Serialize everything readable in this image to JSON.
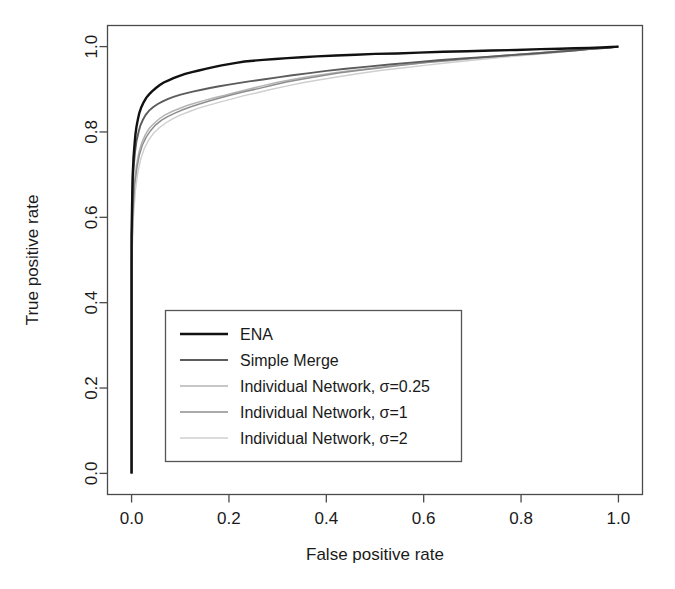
{
  "chart_data": {
    "type": "line",
    "title": "",
    "xlabel": "False positive rate",
    "ylabel": "True positive rate",
    "xlim": [
      0.0,
      1.0
    ],
    "ylim": [
      0.0,
      1.0
    ],
    "xticks": [
      "0.0",
      "0.2",
      "0.4",
      "0.6",
      "0.8",
      "1.0"
    ],
    "yticks": [
      "0.0",
      "0.2",
      "0.4",
      "0.6",
      "0.8",
      "1.0"
    ],
    "xtick_values": [
      0.0,
      0.2,
      0.4,
      0.6,
      0.8,
      1.0
    ],
    "ytick_values": [
      0.0,
      0.2,
      0.4,
      0.6,
      0.8,
      1.0
    ],
    "grid": false,
    "legend_position": "center-left",
    "series": [
      {
        "name": "ENA",
        "color": "#111111",
        "width": 2.4,
        "x": [
          0.0,
          0.0,
          0.002,
          0.004,
          0.006,
          0.008,
          0.01,
          0.013,
          0.016,
          0.02,
          0.025,
          0.03,
          0.036,
          0.042,
          0.05,
          0.058,
          0.066,
          0.076,
          0.086,
          0.097,
          0.11,
          0.124,
          0.138,
          0.152,
          0.168,
          0.185,
          0.2,
          0.215,
          0.232,
          0.25,
          0.27,
          0.295,
          0.32,
          0.35,
          0.38,
          0.42,
          0.46,
          0.5,
          0.545,
          0.59,
          0.64,
          0.69,
          0.74,
          0.79,
          0.84,
          0.88,
          0.91,
          0.94,
          0.965,
          0.985,
          1.0
        ],
        "y": [
          0.0,
          0.56,
          0.69,
          0.74,
          0.77,
          0.795,
          0.812,
          0.83,
          0.845,
          0.858,
          0.87,
          0.88,
          0.888,
          0.895,
          0.903,
          0.91,
          0.916,
          0.921,
          0.926,
          0.931,
          0.936,
          0.94,
          0.944,
          0.948,
          0.952,
          0.956,
          0.959,
          0.962,
          0.965,
          0.967,
          0.969,
          0.971,
          0.973,
          0.975,
          0.977,
          0.979,
          0.981,
          0.983,
          0.984,
          0.986,
          0.988,
          0.989,
          0.991,
          0.992,
          0.994,
          0.995,
          0.996,
          0.997,
          0.998,
          0.999,
          1.0
        ]
      },
      {
        "name": "Simple Merge",
        "color": "#5c5c5c",
        "width": 1.9,
        "x": [
          0.0,
          0.0,
          0.002,
          0.004,
          0.007,
          0.01,
          0.014,
          0.018,
          0.023,
          0.029,
          0.036,
          0.044,
          0.053,
          0.063,
          0.074,
          0.086,
          0.099,
          0.113,
          0.128,
          0.144,
          0.161,
          0.18,
          0.2,
          0.222,
          0.245,
          0.27,
          0.3,
          0.33,
          0.365,
          0.4,
          0.44,
          0.485,
          0.53,
          0.58,
          0.63,
          0.68,
          0.73,
          0.78,
          0.83,
          0.875,
          0.91,
          0.94,
          0.965,
          0.985,
          1.0
        ],
        "y": [
          0.0,
          0.53,
          0.66,
          0.715,
          0.752,
          0.778,
          0.798,
          0.815,
          0.828,
          0.84,
          0.85,
          0.858,
          0.865,
          0.871,
          0.877,
          0.882,
          0.887,
          0.891,
          0.895,
          0.899,
          0.903,
          0.907,
          0.911,
          0.915,
          0.919,
          0.923,
          0.928,
          0.933,
          0.938,
          0.943,
          0.948,
          0.953,
          0.958,
          0.963,
          0.968,
          0.972,
          0.976,
          0.98,
          0.984,
          0.988,
          0.991,
          0.994,
          0.996,
          0.998,
          1.0
        ]
      },
      {
        "name": "Individual Network, σ=0.25",
        "color": "#b4b4b4",
        "width": 1.5,
        "x": [
          0.0,
          0.0,
          0.003,
          0.006,
          0.01,
          0.015,
          0.021,
          0.028,
          0.036,
          0.046,
          0.057,
          0.069,
          0.083,
          0.098,
          0.114,
          0.131,
          0.15,
          0.17,
          0.192,
          0.215,
          0.24,
          0.268,
          0.298,
          0.33,
          0.365,
          0.4,
          0.44,
          0.485,
          0.53,
          0.58,
          0.63,
          0.68,
          0.73,
          0.78,
          0.83,
          0.875,
          0.915,
          0.95,
          0.98,
          1.0
        ],
        "y": [
          0.0,
          0.5,
          0.625,
          0.682,
          0.722,
          0.752,
          0.775,
          0.793,
          0.808,
          0.82,
          0.831,
          0.84,
          0.848,
          0.855,
          0.862,
          0.868,
          0.874,
          0.88,
          0.886,
          0.893,
          0.9,
          0.908,
          0.916,
          0.923,
          0.93,
          0.936,
          0.942,
          0.948,
          0.954,
          0.96,
          0.966,
          0.971,
          0.976,
          0.981,
          0.985,
          0.989,
          0.992,
          0.995,
          0.998,
          1.0
        ]
      },
      {
        "name": "Individual Network, σ=1",
        "color": "#8e8e8e",
        "width": 1.5,
        "x": [
          0.0,
          0.0,
          0.003,
          0.006,
          0.011,
          0.016,
          0.022,
          0.03,
          0.039,
          0.049,
          0.061,
          0.074,
          0.089,
          0.105,
          0.122,
          0.141,
          0.161,
          0.183,
          0.206,
          0.231,
          0.258,
          0.287,
          0.318,
          0.352,
          0.388,
          0.425,
          0.465,
          0.508,
          0.553,
          0.6,
          0.65,
          0.7,
          0.75,
          0.8,
          0.85,
          0.893,
          0.93,
          0.96,
          0.983,
          1.0
        ],
        "y": [
          0.0,
          0.495,
          0.618,
          0.675,
          0.716,
          0.746,
          0.769,
          0.788,
          0.803,
          0.816,
          0.827,
          0.836,
          0.844,
          0.852,
          0.859,
          0.866,
          0.873,
          0.88,
          0.887,
          0.894,
          0.901,
          0.909,
          0.917,
          0.924,
          0.931,
          0.938,
          0.944,
          0.95,
          0.956,
          0.962,
          0.967,
          0.972,
          0.977,
          0.982,
          0.986,
          0.99,
          0.993,
          0.996,
          0.998,
          1.0
        ]
      },
      {
        "name": "Individual Network, σ=2",
        "color": "#cfcfcf",
        "width": 1.4,
        "x": [
          0.0,
          0.0,
          0.004,
          0.008,
          0.013,
          0.019,
          0.026,
          0.035,
          0.045,
          0.057,
          0.07,
          0.085,
          0.101,
          0.119,
          0.138,
          0.159,
          0.181,
          0.205,
          0.231,
          0.258,
          0.288,
          0.32,
          0.354,
          0.39,
          0.428,
          0.468,
          0.51,
          0.555,
          0.602,
          0.65,
          0.7,
          0.752,
          0.803,
          0.852,
          0.898,
          0.935,
          0.965,
          0.988,
          1.0
        ],
        "y": [
          0.0,
          0.48,
          0.605,
          0.664,
          0.706,
          0.737,
          0.761,
          0.781,
          0.797,
          0.81,
          0.821,
          0.831,
          0.84,
          0.848,
          0.856,
          0.863,
          0.87,
          0.877,
          0.885,
          0.892,
          0.9,
          0.908,
          0.916,
          0.923,
          0.93,
          0.937,
          0.944,
          0.95,
          0.956,
          0.962,
          0.968,
          0.974,
          0.979,
          0.984,
          0.989,
          0.993,
          0.996,
          0.999,
          1.0
        ]
      }
    ]
  },
  "legend": {
    "entries": [
      {
        "label": "ENA"
      },
      {
        "label": "Simple Merge"
      },
      {
        "label": "Individual Network, σ=0.25"
      },
      {
        "label": "Individual Network, σ=1"
      },
      {
        "label": "Individual Network, σ=2"
      }
    ]
  },
  "axes": {
    "x_title": "False positive rate",
    "y_title": "True positive rate"
  }
}
